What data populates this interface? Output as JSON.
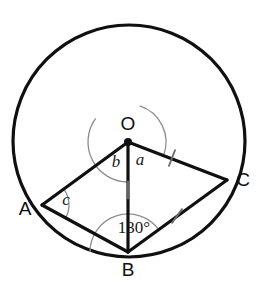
{
  "figure": {
    "type": "geometry-diagram",
    "background_color": "#ffffff",
    "stroke_color": "#101010",
    "arc_color": "#8c8c8c",
    "width": 273,
    "height": 303
  },
  "circle": {
    "name": "circumscribing-circle",
    "center_x": 129,
    "center_y": 141,
    "radius": 116,
    "stroke_width": 3.2,
    "stroke_color": "#101010",
    "fill": "none"
  },
  "points": [
    {
      "id": "O",
      "label": "O",
      "x": 128,
      "y": 142,
      "label_x": 128,
      "label_y": 125,
      "is_center": true,
      "dot_radius": 4
    },
    {
      "id": "A",
      "label": "A",
      "x": 42,
      "y": 205,
      "label_x": 25,
      "label_y": 210,
      "is_center": false,
      "dot_radius": 0
    },
    {
      "id": "B",
      "label": "B",
      "x": 128,
      "y": 252,
      "label_x": 128,
      "label_y": 271,
      "is_center": false,
      "dot_radius": 0
    },
    {
      "id": "C",
      "label": "C",
      "x": 227,
      "y": 180,
      "label_x": 243,
      "label_y": 181,
      "is_center": false,
      "dot_radius": 0
    }
  ],
  "segments": [
    {
      "name": "segment-OA",
      "from": "O",
      "to": "A",
      "x1": 128,
      "y1": 142,
      "x2": 42,
      "y2": 205,
      "stroke_width": 3.2
    },
    {
      "name": "segment-OC",
      "from": "O",
      "to": "C",
      "x1": 128,
      "y1": 142,
      "x2": 227,
      "y2": 180,
      "stroke_width": 3.2
    },
    {
      "name": "segment-OB",
      "from": "O",
      "to": "B",
      "x1": 128,
      "y1": 142,
      "x2": 128,
      "y2": 252,
      "stroke_width": 3.2
    },
    {
      "name": "segment-AB",
      "from": "A",
      "to": "B",
      "x1": 42,
      "y1": 205,
      "x2": 128,
      "y2": 252,
      "stroke_width": 3.2
    },
    {
      "name": "segment-BC",
      "from": "B",
      "to": "C",
      "x1": 128,
      "y1": 252,
      "x2": 227,
      "y2": 180,
      "stroke_width": 3.2
    }
  ],
  "tick_marks": [
    {
      "name": "tick-mark-OC",
      "on_segment": "segment-OC",
      "x": 172,
      "y": 158,
      "angle_deg": 111,
      "length": 17
    },
    {
      "name": "tick-mark-OB",
      "on_segment": "segment-OB",
      "x": 128,
      "y": 190,
      "angle_deg": 90,
      "length": 17
    },
    {
      "name": "tick-mark-BC",
      "on_segment": "segment-BC",
      "x": 177,
      "y": 216,
      "angle_deg": 126,
      "length": 17
    }
  ],
  "angle_arcs": [
    {
      "name": "angle-arc-a",
      "vertex": "O",
      "radius": 38,
      "start_deg": -72,
      "end_deg": 21,
      "note": "angle COB at centre, right side"
    },
    {
      "name": "angle-arc-b",
      "vertex": "O",
      "radius": 40,
      "start_deg": 90,
      "end_deg": 216,
      "note": "angle AOB at centre, left side"
    },
    {
      "name": "angle-arc-c",
      "vertex": "A",
      "radius": 27,
      "start_deg": -36,
      "end_deg": 29,
      "note": "angle OAB at vertex A"
    },
    {
      "name": "angle-arc-130",
      "vertex": "B",
      "radius": 38,
      "start_deg": 180,
      "end_deg": 324,
      "note": "angle ABC at vertex B"
    }
  ],
  "angle_labels": [
    {
      "name": "angle-label-a",
      "text": "a",
      "x": 140,
      "y": 161,
      "style": "italic"
    },
    {
      "name": "angle-label-b",
      "text": "b",
      "x": 116,
      "y": 163,
      "style": "italic"
    },
    {
      "name": "angle-label-c",
      "text": "c",
      "x": 66,
      "y": 201,
      "style": "italic"
    },
    {
      "name": "angle-label-130",
      "text": "130°",
      "x": 134,
      "y": 229,
      "style": "normal"
    }
  ]
}
